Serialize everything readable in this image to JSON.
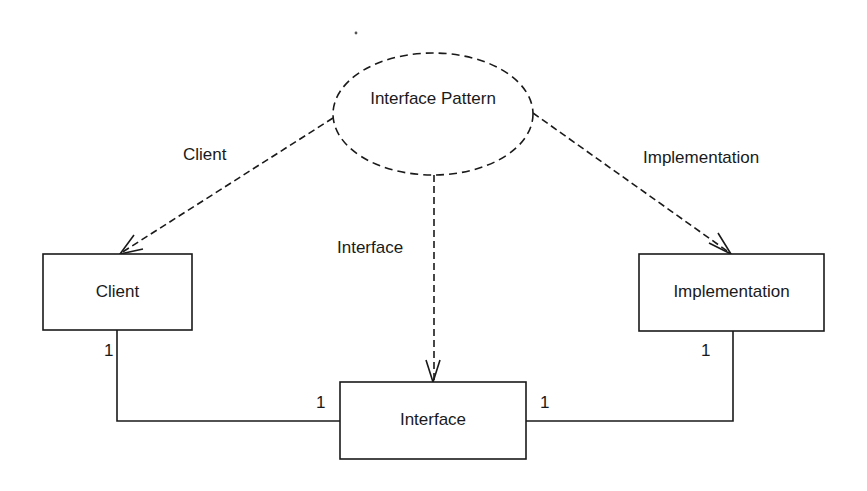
{
  "diagram": {
    "type": "UML pattern diagram",
    "pattern": {
      "label": "Interface Pattern",
      "shape": "dashed-ellipse"
    },
    "classes": [
      {
        "id": "client",
        "label": "Client"
      },
      {
        "id": "interface",
        "label": "Interface"
      },
      {
        "id": "implementation",
        "label": "Implementation"
      }
    ],
    "role_edges": [
      {
        "from": "pattern",
        "to": "client",
        "label": "Client",
        "style": "dashed-arrow"
      },
      {
        "from": "pattern",
        "to": "interface",
        "label": "Interface",
        "style": "dashed-arrow"
      },
      {
        "from": "pattern",
        "to": "implementation",
        "label": "Implementation",
        "style": "dashed-arrow"
      }
    ],
    "associations": [
      {
        "from": "client",
        "to": "interface",
        "from_multiplicity": "1",
        "to_multiplicity": "1"
      },
      {
        "from": "implementation",
        "to": "interface",
        "from_multiplicity": "1",
        "to_multiplicity": "1"
      }
    ],
    "colors": {
      "stroke": "#1a1a1a",
      "background": "#ffffff"
    }
  }
}
